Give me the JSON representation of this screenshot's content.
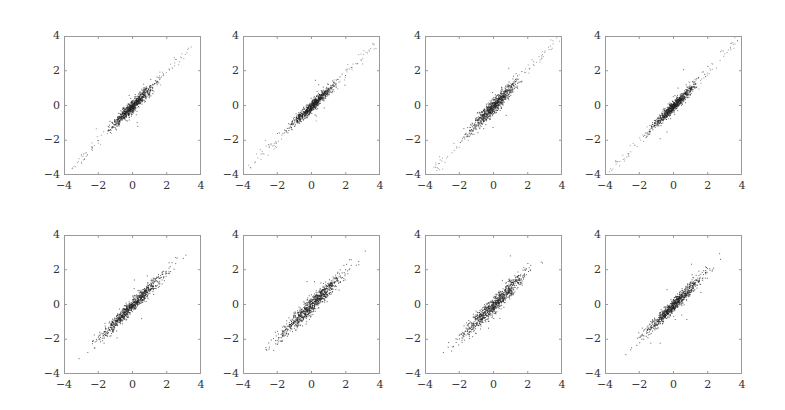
{
  "figure": {
    "rows": 2,
    "cols": 4,
    "frame_color": "#9a9a9a",
    "point_color": "#222222",
    "tick_label_color": "#333333"
  },
  "chart_data": [
    {
      "type": "scatter",
      "panel": 1,
      "row": 1,
      "col": 1,
      "xlim": [
        -4,
        4
      ],
      "ylim": [
        -4,
        4
      ],
      "xticks": [
        "−4",
        "−2",
        "0",
        "2",
        "4"
      ],
      "yticks": [
        "4",
        "2",
        "0",
        "−2",
        "−4"
      ],
      "n_points": 900,
      "correlation": 0.96,
      "core_sd": 0.6,
      "slope": 1.0,
      "tail_extent": 3.6,
      "x_range_approx": [
        -3.8,
        3.4
      ],
      "seed": 11
    },
    {
      "type": "scatter",
      "panel": 2,
      "row": 1,
      "col": 2,
      "xlim": [
        -4,
        4
      ],
      "ylim": [
        -4,
        4
      ],
      "xticks": [
        "−4",
        "−2",
        "0",
        "2",
        "4"
      ],
      "yticks": [
        "4",
        "2",
        "0",
        "−2",
        "−4"
      ],
      "n_points": 900,
      "correlation": 0.97,
      "core_sd": 0.6,
      "slope": 0.95,
      "tail_extent": 3.7,
      "x_range_approx": [
        -3.6,
        3.7
      ],
      "seed": 23
    },
    {
      "type": "scatter",
      "panel": 3,
      "row": 1,
      "col": 3,
      "xlim": [
        -4,
        4
      ],
      "ylim": [
        -4,
        4
      ],
      "xticks": [
        "−4",
        "−2",
        "0",
        "2",
        "4"
      ],
      "yticks": [
        "4",
        "2",
        "0",
        "−2",
        "−4"
      ],
      "n_points": 900,
      "correlation": 0.95,
      "core_sd": 0.65,
      "slope": 1.05,
      "tail_extent": 3.7,
      "x_range_approx": [
        -3.8,
        3.3
      ],
      "seed": 37
    },
    {
      "type": "scatter",
      "panel": 4,
      "row": 1,
      "col": 4,
      "xlim": [
        -4,
        4
      ],
      "ylim": [
        -4,
        4
      ],
      "xticks": [
        "−4",
        "−2",
        "0",
        "2",
        "4"
      ],
      "yticks": [
        "4",
        "2",
        "0",
        "−2",
        "−4"
      ],
      "n_points": 900,
      "correlation": 0.97,
      "core_sd": 0.6,
      "slope": 1.0,
      "tail_extent": 3.8,
      "x_range_approx": [
        -3.7,
        3.7
      ],
      "seed": 41
    },
    {
      "type": "scatter",
      "panel": 5,
      "row": 2,
      "col": 1,
      "xlim": [
        -4,
        4
      ],
      "ylim": [
        -4,
        4
      ],
      "xticks": [
        "−4",
        "−2",
        "0",
        "2",
        "4"
      ],
      "yticks": [
        "4",
        "2",
        "0",
        "−2",
        "−4"
      ],
      "n_points": 900,
      "correlation": 0.98,
      "core_sd": 0.9,
      "slope": 1.0,
      "tail_extent": 0,
      "x_range_approx": [
        -2.2,
        2.4
      ],
      "seed": 53
    },
    {
      "type": "scatter",
      "panel": 6,
      "row": 2,
      "col": 2,
      "xlim": [
        -4,
        4
      ],
      "ylim": [
        -4,
        4
      ],
      "xticks": [
        "−4",
        "−2",
        "0",
        "2",
        "4"
      ],
      "yticks": [
        "4",
        "2",
        "0",
        "−2",
        "−4"
      ],
      "n_points": 900,
      "correlation": 0.97,
      "core_sd": 0.9,
      "slope": 1.0,
      "tail_extent": 0,
      "x_range_approx": [
        -2.4,
        2.2
      ],
      "seed": 67
    },
    {
      "type": "scatter",
      "panel": 7,
      "row": 2,
      "col": 3,
      "xlim": [
        -4,
        4
      ],
      "ylim": [
        -4,
        4
      ],
      "xticks": [
        "−4",
        "−2",
        "0",
        "2",
        "4"
      ],
      "yticks": [
        "4",
        "2",
        "0",
        "−2",
        "−4"
      ],
      "n_points": 900,
      "correlation": 0.97,
      "core_sd": 0.9,
      "slope": 1.0,
      "tail_extent": 0,
      "x_range_approx": [
        -2.3,
        2.3
      ],
      "seed": 79
    },
    {
      "type": "scatter",
      "panel": 8,
      "row": 2,
      "col": 4,
      "xlim": [
        -4,
        4
      ],
      "ylim": [
        -4,
        4
      ],
      "xticks": [
        "−4",
        "−2",
        "0",
        "2",
        "4"
      ],
      "yticks": [
        "4",
        "2",
        "0",
        "−2",
        "−4"
      ],
      "n_points": 900,
      "correlation": 0.98,
      "core_sd": 0.85,
      "slope": 1.0,
      "tail_extent": 0,
      "x_range_approx": [
        -2.2,
        2.2
      ],
      "seed": 97
    }
  ]
}
